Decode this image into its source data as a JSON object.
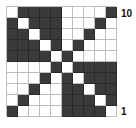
{
  "grid": {
    "rows": 10,
    "cols": 10,
    "colors": {
      "dark": "#3a3a3a",
      "light": "#ffffff",
      "line": "#bdbdbd"
    },
    "cells": [
      [
        0,
        1,
        1,
        1,
        1,
        0,
        0,
        0,
        0,
        1
      ],
      [
        1,
        0,
        1,
        1,
        1,
        0,
        0,
        0,
        1,
        0
      ],
      [
        1,
        1,
        0,
        1,
        1,
        0,
        0,
        1,
        0,
        0
      ],
      [
        1,
        1,
        1,
        0,
        1,
        0,
        1,
        0,
        0,
        0
      ],
      [
        1,
        1,
        1,
        1,
        0,
        1,
        0,
        0,
        0,
        0
      ],
      [
        0,
        0,
        0,
        0,
        1,
        0,
        1,
        1,
        1,
        1
      ],
      [
        0,
        0,
        0,
        1,
        0,
        1,
        0,
        1,
        1,
        1
      ],
      [
        0,
        0,
        1,
        0,
        0,
        1,
        1,
        0,
        1,
        1
      ],
      [
        0,
        1,
        0,
        0,
        0,
        1,
        1,
        1,
        0,
        1
      ],
      [
        1,
        0,
        0,
        0,
        0,
        1,
        1,
        1,
        1,
        0
      ]
    ]
  },
  "labels": {
    "top": "10",
    "bottom": "1"
  }
}
